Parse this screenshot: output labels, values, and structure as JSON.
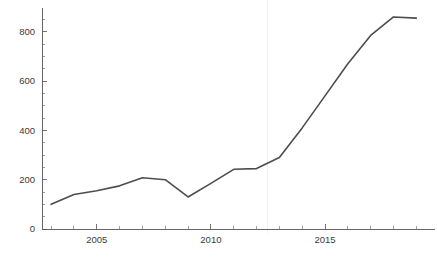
{
  "chart_data": {
    "type": "line",
    "title": "",
    "subtitle": "",
    "xlabel": "",
    "ylabel": "",
    "x": [
      2003,
      2004,
      2005,
      2006,
      2007,
      2008,
      2009,
      2010,
      2011,
      2012,
      2013,
      2014,
      2015,
      2016,
      2017,
      2018,
      2019
    ],
    "series": [
      {
        "name": "",
        "values": [
          100,
          140,
          155,
          175,
          208,
          200,
          130,
          185,
          242,
          245,
          290,
          410,
          540,
          670,
          785,
          860,
          855
        ]
      }
    ],
    "xlim": [
      2002.6,
      2019.6
    ],
    "ylim": [
      0,
      880
    ],
    "y_ticks": [
      0,
      200,
      400,
      600,
      800
    ],
    "y_tick_labels": [
      "0",
      "200",
      "400",
      "600",
      "800"
    ],
    "y_minor_tick_step": 50,
    "x_ticks": [
      2005,
      2010,
      2015
    ],
    "x_tick_labels": [
      "2005",
      "2010",
      "2015"
    ],
    "x_minor_tick_step": 1,
    "grid": false,
    "vertical_marker_x": 2012.5,
    "legend": [],
    "legend_position": "none",
    "colors": {
      "line": "#4d4d4d",
      "axis": "#555555",
      "tick_label": "#3a3a3a",
      "marker_line": "#ececec",
      "background": "#ffffff"
    }
  }
}
